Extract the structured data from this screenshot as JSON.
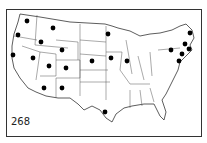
{
  "map": {
    "label": "268",
    "dot_color": "#000000",
    "line_color": "#333333",
    "dots": [
      {
        "state": "WA",
        "x": 27,
        "y": 21
      },
      {
        "state": "OR",
        "x": 18,
        "y": 35
      },
      {
        "state": "ID",
        "x": 41,
        "y": 42
      },
      {
        "state": "MT",
        "x": 53,
        "y": 28
      },
      {
        "state": "WY",
        "x": 62,
        "y": 50
      },
      {
        "state": "CA",
        "x": 13,
        "y": 55
      },
      {
        "state": "NV",
        "x": 33,
        "y": 58
      },
      {
        "state": "UT",
        "x": 49,
        "y": 66
      },
      {
        "state": "CO",
        "x": 66,
        "y": 68
      },
      {
        "state": "AZ",
        "x": 44,
        "y": 88
      },
      {
        "state": "NM",
        "x": 62,
        "y": 88
      },
      {
        "state": "NE",
        "x": 92,
        "y": 61
      },
      {
        "state": "MN",
        "x": 108,
        "y": 34
      },
      {
        "state": "IA",
        "x": 111,
        "y": 58
      },
      {
        "state": "IL",
        "x": 127,
        "y": 61
      },
      {
        "state": "TX",
        "x": 105,
        "y": 112
      },
      {
        "state": "NY",
        "x": 171,
        "y": 50
      },
      {
        "state": "ME",
        "x": 190,
        "y": 33
      },
      {
        "state": "NH",
        "x": 185,
        "y": 44
      },
      {
        "state": "MA",
        "x": 189,
        "y": 49
      },
      {
        "state": "CT",
        "x": 182,
        "y": 54
      },
      {
        "state": "NJ",
        "x": 179,
        "y": 61
      }
    ]
  }
}
